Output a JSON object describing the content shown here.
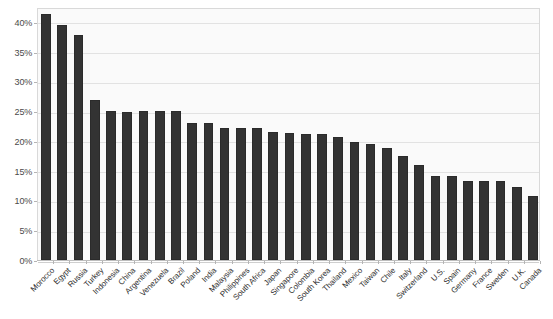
{
  "chart_data": {
    "type": "bar",
    "title": "",
    "xlabel": "",
    "ylabel": "",
    "ylim": [
      0,
      42.5
    ],
    "grid": true,
    "legend": "none",
    "bar_color": "#333333",
    "plot_background": "#fafafa",
    "gridline_color": "#e2e2e2",
    "y_ticks": [
      "0%",
      "5%",
      "10%",
      "15%",
      "20%",
      "25%",
      "30%",
      "35%",
      "40%"
    ],
    "y_tick_values": [
      0,
      5,
      10,
      15,
      20,
      25,
      30,
      35,
      40
    ],
    "categories": [
      "Morocco",
      "Egypt",
      "Russia",
      "Turkey",
      "Indonesia",
      "China",
      "Argentina",
      "Venezuela",
      "Brazil",
      "Poland",
      "India",
      "Malaysia",
      "Philippines",
      "South Africa",
      "Japan",
      "Singapore",
      "Colombia",
      "South Korea",
      "Thailand",
      "Mexico",
      "Taiwan",
      "Chile",
      "Italy",
      "Switzerland",
      "U.S.",
      "Spain",
      "Germany",
      "France",
      "Sweden",
      "U.K.",
      "Canada"
    ],
    "values": [
      41.4,
      39.5,
      37.8,
      26.8,
      25.0,
      24.9,
      25.0,
      25.1,
      25.0,
      23.1,
      23.1,
      22.2,
      22.2,
      22.2,
      21.5,
      21.3,
      21.2,
      21.2,
      20.6,
      19.9,
      19.5,
      18.8,
      17.4,
      15.9,
      14.1,
      14.1,
      13.2,
      13.2,
      13.2,
      12.3,
      10.8
    ]
  }
}
